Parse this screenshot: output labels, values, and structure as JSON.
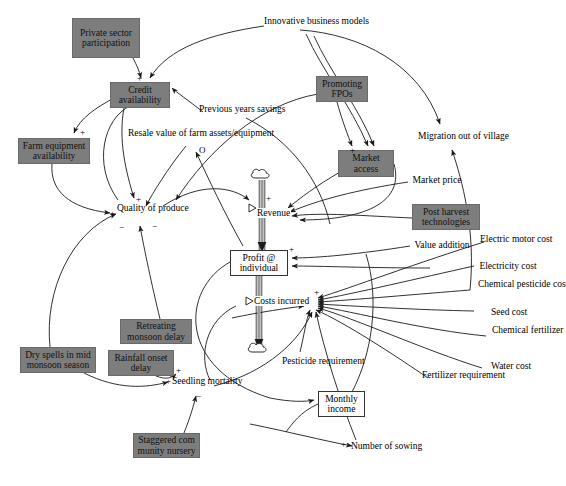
{
  "diagram": {
    "type": "causal-loop-stock-flow",
    "title": "",
    "palette": {
      "box_fill": "#7d7d7d",
      "stock_fill": "#fdfdfd",
      "line": "#1a1a1a",
      "background": "#ffffff"
    },
    "gray_variables": [
      {
        "id": "private-sector-participation",
        "label": "Private sector participation",
        "x": 72,
        "y": 18,
        "w": 68,
        "h": 40
      },
      {
        "id": "credit-availability",
        "label": "Credit availability",
        "x": 110,
        "y": 82,
        "w": 60,
        "h": 26
      },
      {
        "id": "farm-equipment-availability",
        "label": "Farm equipment availability",
        "x": 18,
        "y": 138,
        "w": 72,
        "h": 26
      },
      {
        "id": "promoting-fpos",
        "label": "Promoting FPOs",
        "x": 316,
        "y": 76,
        "w": 52,
        "h": 26
      },
      {
        "id": "market-access",
        "label": "Market access",
        "x": 338,
        "y": 150,
        "w": 56,
        "h": 27
      },
      {
        "id": "post-harvest-technologies",
        "label": "Post harvest technologies",
        "x": 412,
        "y": 204,
        "w": 68,
        "h": 26
      },
      {
        "id": "retreating-monsoon-delay",
        "label": "Retreating monsoon delay",
        "x": 120,
        "y": 319,
        "w": 72,
        "h": 25
      },
      {
        "id": "dry-spells-in-mid-monsoon-season",
        "label": "Dry spells in mid monsoon season",
        "x": 20,
        "y": 347,
        "w": 76,
        "h": 26
      },
      {
        "id": "rainfall-onset-delay",
        "label": "Rainfall onset delay",
        "x": 108,
        "y": 350,
        "w": 66,
        "h": 26
      },
      {
        "id": "staggered-community-nursery",
        "label": "Staggered com munity nursery",
        "x": 133,
        "y": 433,
        "w": 67,
        "h": 25
      }
    ],
    "stock_boxes": [
      {
        "id": "profit-at-individual",
        "label": "Profit @ individual",
        "x": 230,
        "y": 250,
        "w": 58,
        "h": 26
      },
      {
        "id": "monthly-income",
        "label": "Monthly income",
        "x": 318,
        "y": 391,
        "w": 47,
        "h": 26
      }
    ],
    "flow_labels": [
      {
        "id": "revenue",
        "label": "Revenue",
        "x": 252,
        "y": 208
      },
      {
        "id": "costs-incurred",
        "label": "Costs incurred",
        "x": 249,
        "y": 301
      }
    ],
    "plain_variables": [
      {
        "id": "innovative-business-models",
        "label": "Innovative business models",
        "x": 266,
        "y": 16,
        "lines": [
          "Innovative",
          "business models"
        ]
      },
      {
        "id": "previous-years-savings",
        "label": "Previous years savings",
        "x": 203,
        "y": 105,
        "lines": [
          "Previous years",
          "savings"
        ]
      },
      {
        "id": "resale-value-of-farm-assets-equipment",
        "label": "Resale value of farm assets/equipment",
        "x": 132,
        "y": 130,
        "lines": [
          "Resale value of farm",
          "assets/equipment"
        ]
      },
      {
        "id": "quality-of-produce",
        "label": "Quality of produce",
        "x": 121,
        "y": 205,
        "lines": [
          "Quality of",
          "produce"
        ]
      },
      {
        "id": "migration-out-of-village",
        "label": "Migration out of village",
        "x": 422,
        "y": 133,
        "lines": [
          "Migration out of",
          "village"
        ]
      },
      {
        "id": "market-price",
        "label": "Market price",
        "x": 410,
        "y": 176,
        "lines": [
          "Market price"
        ]
      },
      {
        "id": "value-addition",
        "label": "Value addition",
        "x": 412,
        "y": 241,
        "lines": [
          "Value addition"
        ]
      },
      {
        "id": "electric-motor-cost",
        "label": "Electric motor cost",
        "x": 487,
        "y": 236,
        "lines": [
          "Electric motor",
          "cost"
        ]
      },
      {
        "id": "electricity-cost",
        "label": "Electricity cost",
        "x": 477,
        "y": 265,
        "lines": [
          "Electricity cost"
        ]
      },
      {
        "id": "chemical-pesticide-cost",
        "label": "Chemical pesticide cost",
        "x": 485,
        "y": 283,
        "lines": [
          "Chemical",
          "pesticide cost"
        ]
      },
      {
        "id": "seed-cost",
        "label": "Seed cost",
        "x": 487,
        "y": 311,
        "lines": [
          "Seed cost"
        ]
      },
      {
        "id": "chemical-fertilizer-cost",
        "label": "Chemical fertilizer cost",
        "x": 500,
        "y": 329,
        "lines": [
          "Chemical",
          "fertilizer cost"
        ]
      },
      {
        "id": "water-cost",
        "label": "Water cost",
        "x": 485,
        "y": 365,
        "lines": [
          "Water cost"
        ]
      },
      {
        "id": "fertilizer-requirement",
        "label": "Fertilizer requirement",
        "x": 428,
        "y": 372,
        "lines": [
          "Fertilizer",
          "requirement"
        ]
      },
      {
        "id": "pesticide-requirement",
        "label": "Pesticide requirement",
        "x": 288,
        "y": 358,
        "lines": [
          "Pesticide",
          "requirement"
        ]
      },
      {
        "id": "seedling-mortality",
        "label": "Seedling mortality",
        "x": 175,
        "y": 378,
        "lines": [
          "Seedling",
          "mortality"
        ]
      },
      {
        "id": "number-of-sowing",
        "label": "Number of sowing",
        "x": 357,
        "y": 443,
        "lines": [
          "Number of",
          "sowing"
        ]
      }
    ],
    "polarity_marks": [
      {
        "id": "p-credit-in",
        "sign": "+",
        "x": 137,
        "y": 74
      },
      {
        "id": "p-farm-equip",
        "sign": "+",
        "x": 80,
        "y": 128
      },
      {
        "id": "p-quality-left",
        "sign": "+",
        "x": 110,
        "y": 209
      },
      {
        "id": "p-quality-top",
        "sign": "+",
        "x": 136,
        "y": 195
      },
      {
        "id": "p-quality-below",
        "sign": "−",
        "x": 119,
        "y": 223
      },
      {
        "id": "p-quality-below2",
        "sign": "−",
        "x": 152,
        "y": 222
      },
      {
        "id": "p-resale-o",
        "sign": "O",
        "x": 199,
        "y": 152
      },
      {
        "id": "p-revenue-in",
        "sign": "+",
        "x": 266,
        "y": 196
      },
      {
        "id": "p-market-access",
        "sign": "+",
        "x": 369,
        "y": 139
      },
      {
        "id": "p-market-access2",
        "sign": "+",
        "x": 350,
        "y": 148
      },
      {
        "id": "p-profit-right",
        "sign": "+",
        "x": 289,
        "y": 247
      },
      {
        "id": "p-costs-right",
        "sign": "+",
        "x": 314,
        "y": 290
      },
      {
        "id": "p-seedling-1",
        "sign": "+",
        "x": 176,
        "y": 368
      },
      {
        "id": "p-seedling-2",
        "sign": "+",
        "x": 168,
        "y": 379
      },
      {
        "id": "p-seedling-3",
        "sign": "−",
        "x": 196,
        "y": 394
      },
      {
        "id": "p-number-sowing",
        "sign": "+",
        "x": 343,
        "y": 440
      }
    ]
  }
}
